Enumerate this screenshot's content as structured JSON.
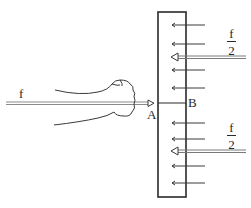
{
  "diagram": {
    "type": "physics-force-diagram",
    "labels": {
      "force_applied": "f",
      "point_a": "A",
      "point_b": "B",
      "reaction_top": {
        "numerator": "f",
        "denominator": "2"
      },
      "reaction_bottom": {
        "numerator": "f",
        "denominator": "2"
      }
    },
    "colors": {
      "ink": "#2a2a2a",
      "force_arrow": "#8a8a8a"
    },
    "small_arrows_y": [
      25,
      44,
      70,
      88,
      123,
      139,
      166,
      183
    ],
    "big_arrows_y": [
      57,
      151
    ]
  }
}
